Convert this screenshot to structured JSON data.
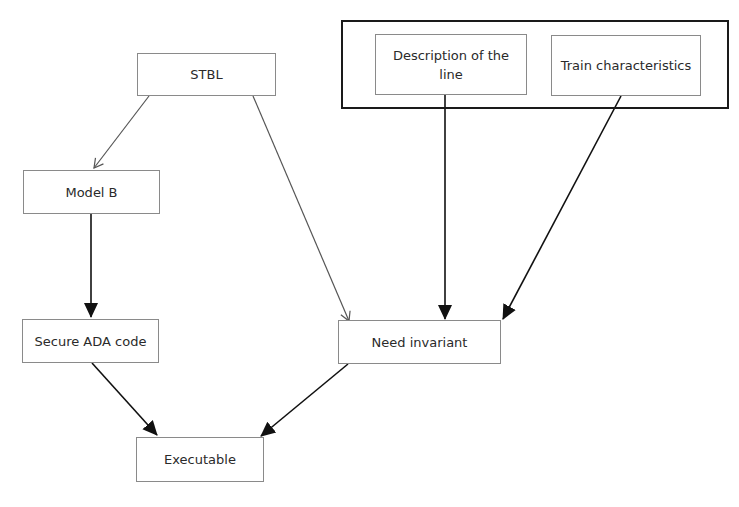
{
  "diagram": {
    "type": "flowchart",
    "nodes": {
      "stbl": {
        "label": "STBL"
      },
      "model_b": {
        "label": "Model B"
      },
      "secure_ada": {
        "label": "Secure ADA code"
      },
      "description_line": {
        "label": "Description of the line"
      },
      "train_characteristics": {
        "label": "Train characteristics"
      },
      "need_invariant": {
        "label": "Need invariant"
      },
      "executable": {
        "label": "Executable"
      }
    },
    "group": {
      "members": [
        "Description of the line",
        "Train characteristics"
      ]
    },
    "edges": [
      {
        "from": "STBL",
        "to": "Model B",
        "style": "thin-open-arrow"
      },
      {
        "from": "STBL",
        "to": "Need invariant",
        "style": "thin-open-arrow"
      },
      {
        "from": "Model B",
        "to": "Secure ADA code",
        "style": "bold-filled-arrow"
      },
      {
        "from": "Description of the line",
        "to": "Need invariant",
        "style": "bold-filled-arrow"
      },
      {
        "from": "Train characteristics",
        "to": "Need invariant",
        "style": "bold-filled-arrow"
      },
      {
        "from": "Secure ADA code",
        "to": "Executable",
        "style": "bold-filled-arrow"
      },
      {
        "from": "Need invariant",
        "to": "Executable",
        "style": "bold-filled-arrow"
      }
    ],
    "colors": {
      "node_border": "#8a8a8a",
      "group_border": "#1a1a1a",
      "thin_edge": "#555555",
      "bold_edge": "#111111",
      "text": "#2a2a2a"
    }
  }
}
